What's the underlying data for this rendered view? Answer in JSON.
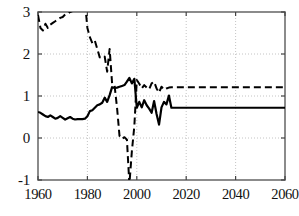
{
  "chart_data": {
    "type": "line",
    "title": "",
    "xlabel": "",
    "ylabel": "",
    "xlim": [
      1960,
      2060
    ],
    "ylim": [
      -1,
      3
    ],
    "grid": true,
    "legend": "none",
    "xticks": [
      1960,
      1980,
      2000,
      2020,
      2040,
      2060
    ],
    "yticks": [
      -1,
      0,
      1,
      2,
      3
    ],
    "xtick_labels": [
      "1960",
      "1980",
      "2000",
      "2020",
      "2040",
      "2060"
    ],
    "ytick_labels": [
      "-1",
      "0",
      "1",
      "2",
      "3"
    ],
    "series": [
      {
        "name": "solid-series",
        "style": "solid",
        "color": "#000000",
        "width": 2.2,
        "x": [
          1960,
          1961,
          1962,
          1963,
          1964,
          1965,
          1966,
          1967,
          1968,
          1969,
          1970,
          1971,
          1972,
          1973,
          1974,
          1975,
          1976,
          1977,
          1978,
          1979,
          1980,
          1981,
          1982,
          1983,
          1984,
          1985,
          1986,
          1987,
          1988,
          1989,
          1990,
          1991,
          1992,
          1993,
          1994,
          1995,
          1996,
          1997,
          1998,
          1999,
          2000,
          2001,
          2002,
          2003,
          2004,
          2005,
          2006,
          2007,
          2008,
          2009,
          2010,
          2011,
          2012,
          2013,
          2014,
          2015,
          2020,
          2030,
          2040,
          2050,
          2060
        ],
        "values": [
          0.62,
          0.6,
          0.56,
          0.52,
          0.5,
          0.54,
          0.5,
          0.46,
          0.48,
          0.52,
          0.48,
          0.44,
          0.47,
          0.5,
          0.46,
          0.44,
          0.45,
          0.45,
          0.45,
          0.46,
          0.52,
          0.64,
          0.66,
          0.72,
          0.78,
          0.8,
          0.84,
          0.96,
          0.86,
          1.02,
          1.21,
          1.19,
          1.2,
          1.22,
          1.24,
          1.26,
          1.34,
          1.43,
          1.3,
          1.41,
          0.72,
          0.86,
          0.73,
          0.9,
          0.78,
          0.7,
          0.6,
          0.88,
          0.57,
          0.32,
          0.73,
          0.86,
          0.8,
          1.01,
          0.72,
          0.72,
          0.72,
          0.72,
          0.72,
          0.72,
          0.72
        ]
      },
      {
        "name": "dashed-series",
        "style": "dashed",
        "color": "#000000",
        "width": 2.0,
        "x": [
          1960,
          1961,
          1962,
          1963,
          1964,
          1965,
          1966,
          1967,
          1968,
          1969,
          1970,
          1971,
          1972,
          1973,
          1974,
          1975,
          1976,
          1977,
          1978,
          1979,
          1980,
          1981,
          1982,
          1983,
          1984,
          1985,
          1986,
          1987,
          1988,
          1989,
          1990,
          1991,
          1992,
          1993,
          1994,
          1995,
          1996,
          1997,
          1998,
          1999,
          2000,
          2001,
          2002,
          2003,
          2004,
          2005,
          2006,
          2007,
          2008,
          2009,
          2010,
          2011,
          2012,
          2013,
          2014,
          2015,
          2020,
          2030,
          2040,
          2050,
          2060
        ],
        "values": [
          2.93,
          2.62,
          2.56,
          2.72,
          2.62,
          2.7,
          2.74,
          2.78,
          2.82,
          2.86,
          2.88,
          2.94,
          2.96,
          3.0,
          3.02,
          3.08,
          3.12,
          3.18,
          3.22,
          3.24,
          2.62,
          2.4,
          2.26,
          2.32,
          2.12,
          1.92,
          1.9,
          1.94,
          1.58,
          2.12,
          1.3,
          1.25,
          0.72,
          0.05,
          -0.02,
          0.02,
          -0.04,
          -1.1,
          -0.32,
          0.28,
          1.38,
          1.29,
          1.18,
          1.26,
          1.2,
          1.16,
          1.3,
          1.34,
          1.18,
          1.08,
          1.22,
          1.15,
          1.18,
          1.2,
          1.21,
          1.21,
          1.21,
          1.21,
          1.21,
          1.21,
          1.21
        ]
      }
    ]
  },
  "axes": {
    "frame_color": "#6e6e6e",
    "grid_color": "#bdbdbd",
    "tick_color": "#444444"
  }
}
